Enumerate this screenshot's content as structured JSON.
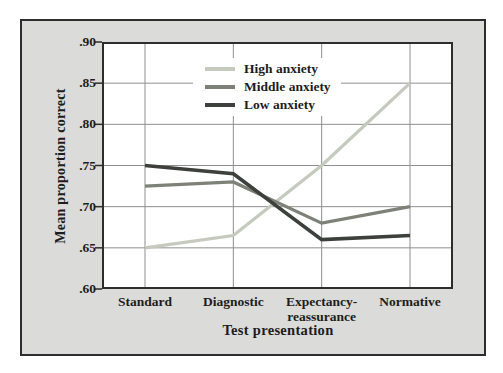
{
  "figure": {
    "background": "#dbdbd9",
    "border_color": "#2d2d2d",
    "plot_background": "#ffffff",
    "gridline_color": "#8f8f8f",
    "axis_color": "#2d2d2d",
    "text_color": "#1d1d1d"
  },
  "chart_data": {
    "type": "line",
    "title": "",
    "xlabel": "Test presentation",
    "ylabel": "Mean proportion correct",
    "categories": [
      "Standard",
      "Diagnostic",
      "Expectancy-reassurance",
      "Normative"
    ],
    "series": [
      {
        "name": "High anxiety",
        "color": "#c6cabe",
        "values": [
          0.65,
          0.665,
          0.75,
          0.85
        ]
      },
      {
        "name": "Middle anxiety",
        "color": "#7d8177",
        "values": [
          0.725,
          0.73,
          0.68,
          0.7
        ]
      },
      {
        "name": "Low anxiety",
        "color": "#3d403b",
        "values": [
          0.75,
          0.74,
          0.66,
          0.665
        ]
      }
    ],
    "ylim": [
      0.6,
      0.9
    ],
    "yticks": [
      {
        "label": ".60",
        "value": 0.6
      },
      {
        "label": ".65",
        "value": 0.65
      },
      {
        "label": ".70",
        "value": 0.7
      },
      {
        "label": ".75",
        "value": 0.75
      },
      {
        "label": ".80",
        "value": 0.8
      },
      {
        "label": ".85",
        "value": 0.85
      },
      {
        "label": ".90",
        "value": 0.9
      }
    ],
    "grid": true,
    "legend_position": "top-center-inside"
  }
}
